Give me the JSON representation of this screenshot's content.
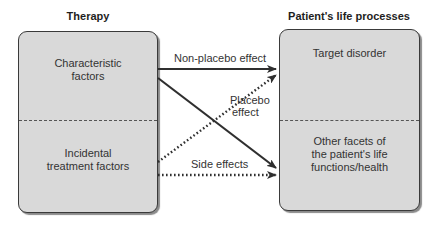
{
  "diagram": {
    "left": {
      "heading": "Therapy",
      "top_section": "Characteristic factors",
      "top_line1": "Characteristic",
      "top_line2": "factors",
      "bottom_section": "Incidental treatment factors",
      "bottom_line1": "Incidental",
      "bottom_line2": "treatment factors"
    },
    "right": {
      "heading": "Patient's life processes",
      "top_section": "Target disorder",
      "bottom_line1": "Other facets of",
      "bottom_line2": "the patient's life",
      "bottom_line3": "functions/health"
    },
    "arrows": {
      "non_placebo": "Non-placebo effect",
      "placebo_line1": "Placebo",
      "placebo_line2": "effect",
      "side_effects": "Side effects"
    },
    "colors": {
      "box_fill": "#d9d9d9",
      "stroke": "#2f2f2f"
    }
  }
}
